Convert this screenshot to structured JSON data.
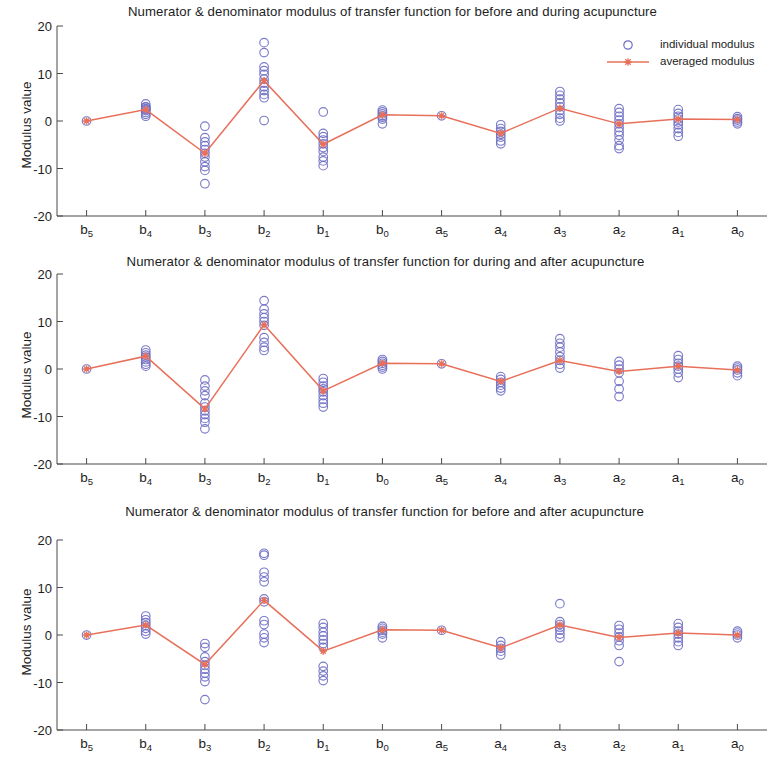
{
  "figure": {
    "ylabel": "Modulus value",
    "yticks": [
      20,
      10,
      0,
      -10,
      -20
    ],
    "ylim": [
      -20,
      20
    ],
    "categories": [
      "b5",
      "b4",
      "b3",
      "b2",
      "b1",
      "b0",
      "a5",
      "a4",
      "a3",
      "a2",
      "a1",
      "a0"
    ],
    "category_labels": [
      {
        "base": "b",
        "sub": "5"
      },
      {
        "base": "b",
        "sub": "4"
      },
      {
        "base": "b",
        "sub": "3"
      },
      {
        "base": "b",
        "sub": "2"
      },
      {
        "base": "b",
        "sub": "1"
      },
      {
        "base": "b",
        "sub": "0"
      },
      {
        "base": "a",
        "sub": "5"
      },
      {
        "base": "a",
        "sub": "4"
      },
      {
        "base": "a",
        "sub": "3"
      },
      {
        "base": "a",
        "sub": "2"
      },
      {
        "base": "a",
        "sub": "1"
      },
      {
        "base": "a",
        "sub": "0"
      }
    ],
    "legend": {
      "individual_label": "individual modulus",
      "averaged_label": "averaged modulus",
      "position": "top-right"
    },
    "colors": {
      "marker": "#6f6fc4",
      "line": "#e8705a",
      "axis": "#4a4a4a",
      "text": "#1d1d1d",
      "background": "#ffffff"
    }
  },
  "chart_data": [
    {
      "type": "scatter",
      "panel": 1,
      "title": "Numerator & denominator modulus of transfer function for before and during acupuncture",
      "xlabel": "",
      "ylabel": "Modulus value",
      "ylim": [
        -20,
        20
      ],
      "yticks": [
        20,
        10,
        0,
        -10,
        -20
      ],
      "grid": false,
      "categories": [
        "b5",
        "b4",
        "b3",
        "b2",
        "b1",
        "b0",
        "a5",
        "a4",
        "a3",
        "a2",
        "a1",
        "a0"
      ],
      "series": [
        {
          "name": "averaged modulus",
          "kind": "line",
          "values": [
            0.0,
            2.4,
            -6.8,
            8.5,
            -4.9,
            1.3,
            1.1,
            -2.6,
            2.7,
            -0.6,
            0.4,
            0.3
          ]
        },
        {
          "name": "individual modulus",
          "kind": "points",
          "points": [
            [
              0.0
            ],
            [
              3.6,
              3.0,
              2.6,
              2.2,
              1.8,
              1.4,
              1.0,
              2.4,
              2.9
            ],
            [
              -1.1,
              -3.5,
              -4.4,
              -5.2,
              -6.0,
              -6.8,
              -7.6,
              -8.6,
              -9.6,
              -10.4,
              -13.2
            ],
            [
              16.5,
              14.4,
              11.4,
              10.6,
              9.8,
              8.8,
              8.0,
              7.2,
              6.4,
              5.6,
              4.9,
              0.1
            ],
            [
              1.9,
              -2.6,
              -3.3,
              -4.0,
              -4.8,
              -5.6,
              -6.4,
              -7.6,
              -8.4,
              -9.4
            ],
            [
              2.3,
              1.9,
              1.5,
              1.1,
              0.8,
              0.4,
              -0.6
            ],
            [
              1.1
            ],
            [
              -0.8,
              -1.6,
              -2.2,
              -2.8,
              -3.4,
              -4.2,
              -4.8
            ],
            [
              6.2,
              5.4,
              4.6,
              3.8,
              3.0,
              2.2,
              1.4,
              0.6,
              0.0
            ],
            [
              2.6,
              1.8,
              1.0,
              0.2,
              -0.6,
              -1.4,
              -2.2,
              -3.0,
              -4.0,
              -5.2,
              -5.8
            ],
            [
              2.4,
              1.6,
              1.0,
              0.4,
              -0.2,
              -0.8,
              -1.6,
              -2.4,
              -3.2
            ],
            [
              0.9,
              0.5,
              0.2,
              -0.2,
              -0.6
            ]
          ]
        }
      ]
    },
    {
      "type": "scatter",
      "panel": 2,
      "title": "Numerator & denominator modulus of transfer function for during and after acupuncture",
      "xlabel": "",
      "ylabel": "Modulus value",
      "ylim": [
        -20,
        20
      ],
      "yticks": [
        20,
        10,
        0,
        -10,
        -20
      ],
      "grid": false,
      "categories": [
        "b5",
        "b4",
        "b3",
        "b2",
        "b1",
        "b0",
        "a5",
        "a4",
        "a3",
        "a2",
        "a1",
        "a0"
      ],
      "series": [
        {
          "name": "averaged modulus",
          "kind": "line",
          "values": [
            0.0,
            2.7,
            -8.4,
            9.3,
            -4.6,
            1.2,
            1.1,
            -2.6,
            1.8,
            -0.5,
            0.6,
            -0.2
          ]
        },
        {
          "name": "individual modulus",
          "kind": "points",
          "points": [
            [
              0.0
            ],
            [
              4.0,
              3.4,
              2.9,
              2.5,
              2.0,
              1.5,
              1.0,
              0.6
            ],
            [
              -2.3,
              -3.6,
              -4.6,
              -5.6,
              -7.2,
              -8.0,
              -8.8,
              -9.6,
              -10.4,
              -11.2,
              -12.6
            ],
            [
              14.4,
              12.6,
              11.6,
              10.8,
              10.0,
              9.2,
              6.6,
              5.6,
              4.6,
              3.9
            ],
            [
              -2.0,
              -2.8,
              -3.6,
              -4.2,
              -4.8,
              -5.6,
              -6.4,
              -7.2,
              -8.0
            ],
            [
              2.0,
              1.6,
              1.2,
              0.8,
              0.4,
              0.0
            ],
            [
              1.1
            ],
            [
              -1.6,
              -2.2,
              -2.8,
              -3.4,
              -4.0,
              -4.6
            ],
            [
              6.4,
              5.4,
              4.6,
              3.6,
              2.6,
              1.8,
              1.0,
              0.2
            ],
            [
              1.6,
              0.8,
              0.0,
              -0.8,
              -2.6,
              -4.2,
              -5.8
            ],
            [
              2.8,
              2.0,
              1.2,
              0.6,
              0.0,
              -0.8,
              -1.8
            ],
            [
              0.6,
              0.2,
              -0.2,
              -0.8,
              -1.4
            ]
          ]
        }
      ]
    },
    {
      "type": "scatter",
      "panel": 3,
      "title": "Numerator & denominator modulus of transfer function for before and after acupuncture",
      "xlabel": "",
      "ylabel": "Modulus value",
      "ylim": [
        -20,
        20
      ],
      "yticks": [
        20,
        10,
        0,
        -10,
        -20
      ],
      "grid": false,
      "categories": [
        "b5",
        "b4",
        "b3",
        "b2",
        "b1",
        "b0",
        "a5",
        "a4",
        "a3",
        "a2",
        "a1",
        "a0"
      ],
      "series": [
        {
          "name": "averaged modulus",
          "kind": "line",
          "values": [
            0.0,
            2.1,
            -6.2,
            7.3,
            -3.4,
            1.1,
            1.0,
            -2.7,
            2.1,
            -0.5,
            0.4,
            0.0
          ]
        },
        {
          "name": "individual modulus",
          "kind": "points",
          "points": [
            [
              0.0
            ],
            [
              4.0,
              3.2,
              2.6,
              2.0,
              1.4,
              0.8,
              0.2
            ],
            [
              -1.8,
              -2.6,
              -4.6,
              -5.6,
              -6.4,
              -7.2,
              -8.0,
              -8.8,
              -9.8,
              -13.6
            ],
            [
              17.2,
              16.8,
              13.2,
              12.2,
              11.2,
              7.6,
              7.0,
              3.0,
              2.2,
              0.2,
              -0.6,
              -1.6
            ],
            [
              2.4,
              1.6,
              0.6,
              -0.2,
              -1.0,
              -1.8,
              -2.6,
              -6.6,
              -7.6,
              -8.6,
              -9.6
            ],
            [
              1.8,
              1.4,
              1.0,
              0.6,
              0.2,
              -0.6
            ],
            [
              1.0
            ],
            [
              -1.4,
              -2.2,
              -2.8,
              -3.4,
              -4.2
            ],
            [
              6.6,
              2.8,
              2.2,
              1.6,
              1.0,
              0.2,
              -0.6
            ],
            [
              2.0,
              1.2,
              0.4,
              -0.4,
              -1.2,
              -2.2,
              -5.6
            ],
            [
              2.4,
              1.6,
              0.8,
              0.2,
              -0.6,
              -1.4,
              -2.2
            ],
            [
              0.8,
              0.4,
              0.0,
              -0.6
            ]
          ]
        }
      ]
    }
  ]
}
